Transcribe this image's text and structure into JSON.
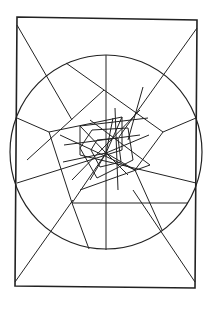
{
  "figure": {
    "width": 208,
    "height": 309,
    "background": "#ffffff",
    "stroke": "#222222",
    "frame": {
      "points": "17,17 197,20 195,288 15,286"
    },
    "circle": {
      "cx": 106,
      "cy": 152,
      "rx": 96,
      "ry": 97
    },
    "center": {
      "x": 106,
      "y": 153
    },
    "lines": [
      [
        17,
        25,
        72,
        120
      ],
      [
        197,
        28,
        119,
        137
      ],
      [
        15,
        282,
        73,
        200
      ],
      [
        195,
        282,
        133,
        190
      ],
      [
        106,
        55,
        106,
        250
      ],
      [
        66,
        63,
        104,
        90
      ],
      [
        104,
        90,
        163,
        132
      ],
      [
        104,
        90,
        27,
        160
      ],
      [
        17,
        118,
        49,
        132
      ],
      [
        49,
        132,
        72,
        203
      ],
      [
        72,
        203,
        89,
        249
      ],
      [
        196,
        118,
        163,
        132
      ],
      [
        163,
        132,
        135,
        170
      ],
      [
        135,
        170,
        162,
        230
      ],
      [
        72,
        203,
        188,
        203
      ],
      [
        135,
        170,
        60,
        135
      ],
      [
        17,
        183,
        122,
        150
      ],
      [
        122,
        150,
        122,
        117
      ],
      [
        122,
        117,
        49,
        132
      ],
      [
        143,
        87,
        128,
        140
      ],
      [
        196,
        183,
        80,
        155
      ],
      [
        80,
        155,
        80,
        126
      ],
      [
        80,
        126,
        148,
        118
      ],
      [
        106,
        153,
        80,
        126
      ],
      [
        106,
        153,
        122,
        117
      ],
      [
        106,
        153,
        135,
        170
      ],
      [
        106,
        153,
        72,
        203
      ],
      [
        106,
        153,
        149,
        135
      ],
      [
        106,
        153,
        63,
        162
      ],
      [
        106,
        153,
        113,
        118
      ],
      [
        106,
        153,
        90,
        180
      ],
      [
        106,
        153,
        128,
        175
      ],
      [
        92,
        130,
        128,
        128
      ],
      [
        128,
        128,
        133,
        160
      ],
      [
        133,
        160,
        97,
        178
      ],
      [
        97,
        178,
        80,
        148
      ],
      [
        80,
        148,
        92,
        130
      ],
      [
        97,
        140,
        118,
        138
      ],
      [
        118,
        138,
        121,
        162
      ],
      [
        121,
        162,
        100,
        167
      ],
      [
        100,
        167,
        91,
        150
      ],
      [
        91,
        150,
        97,
        140
      ],
      [
        90,
        120,
        150,
        165
      ],
      [
        150,
        165,
        80,
        190
      ],
      [
        115,
        108,
        118,
        190
      ],
      [
        64,
        145,
        140,
        135
      ],
      [
        72,
        180,
        140,
        110
      ]
    ]
  }
}
